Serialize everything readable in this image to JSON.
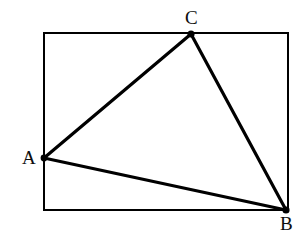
{
  "figure": {
    "background_color": "#ffffff",
    "stroke_color": "#000000",
    "label_color": "#0d0d0d",
    "canvas": {
      "width": 304,
      "height": 238
    },
    "rectangle": {
      "name": "bounding-rectangle",
      "x": 44,
      "y": 33,
      "width": 244,
      "height": 177,
      "stroke_width": 2.2,
      "corners": {
        "top_left": [
          44,
          33
        ],
        "top_right": [
          288,
          33
        ],
        "bottom_right": [
          288,
          210
        ],
        "bottom_left": [
          44,
          210
        ]
      }
    },
    "triangle": {
      "name": "triangle-abc",
      "stroke_width": 3.2,
      "vertices": [
        {
          "label": "A",
          "x": 44,
          "y": 158,
          "dot_radius": 3.4,
          "on_edge": "left"
        },
        {
          "label": "B",
          "x": 286,
          "y": 210,
          "dot_radius": 3.6,
          "on_edge": "bottom-right-corner"
        },
        {
          "label": "C",
          "x": 191,
          "y": 34,
          "dot_radius": 3.6,
          "on_edge": "top"
        }
      ],
      "edges": [
        {
          "name": "edge-AC",
          "from": "A",
          "to": "C"
        },
        {
          "name": "edge-CB",
          "from": "C",
          "to": "B"
        },
        {
          "name": "edge-AB",
          "from": "A",
          "to": "B"
        }
      ]
    },
    "labels": {
      "A": "A",
      "B": "B",
      "C": "C"
    }
  }
}
